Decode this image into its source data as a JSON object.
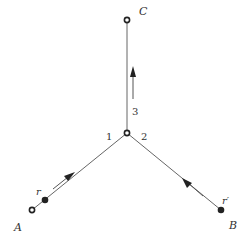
{
  "diagram": {
    "nodes": {
      "A": {
        "label": "A",
        "type": "open-circle"
      },
      "B": {
        "label": "B",
        "type": "filled-dot"
      },
      "C": {
        "label": "C",
        "type": "open-circle"
      },
      "center": {
        "label": "",
        "type": "open-circle"
      },
      "r": {
        "label": "r",
        "type": "filled-dot"
      }
    },
    "branch_labels": [
      "1",
      "2",
      "3"
    ],
    "point_labels": {
      "r": "r",
      "r_prime": "r′"
    },
    "edges": [
      {
        "from": "A",
        "to": "center",
        "branch": "1",
        "arrow": "toward-center"
      },
      {
        "from": "B",
        "to": "center",
        "branch": "2",
        "arrow": "toward-center"
      },
      {
        "from": "center",
        "to": "C",
        "branch": "3",
        "arrow": "toward-C"
      }
    ],
    "colors": {
      "line": "#555555",
      "node": "#222222",
      "text": "#333333"
    }
  }
}
